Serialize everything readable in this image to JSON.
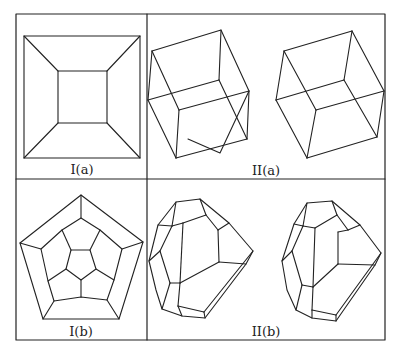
{
  "figure": {
    "panels": [
      {
        "id": "I(a)",
        "label": "I(a)",
        "description": "square frame with inner square (cube viewed face-on)"
      },
      {
        "id": "II(a)",
        "label": "II(a)",
        "description": "stereo pair of wireframe cubes"
      },
      {
        "id": "I(b)",
        "label": "I(b)",
        "description": "Schlegel-style pentagon diagram (dodecahedron)"
      },
      {
        "id": "II(b)",
        "label": "II(b)",
        "description": "stereo pair of wireframe polyhedra"
      }
    ],
    "colors": {
      "line": "#222222",
      "background": "#ffffff"
    }
  }
}
